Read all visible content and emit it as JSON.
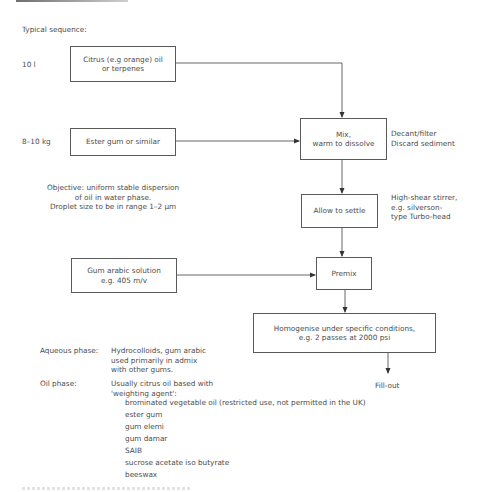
{
  "diagram": {
    "heading": "Typical sequence:",
    "quantities": {
      "citrus": "10 l",
      "ester": "8–10 kg"
    },
    "boxes": {
      "citrus": "Citrus (e.g orange) oil\nor terpenes",
      "ester": "Ester gum or similar",
      "mix": "Mix,\nwarm to dissolve",
      "settle": "Allow to settle",
      "gum_arabic": "Gum arabic solution\ne.g. 405 m/v",
      "premix": "Premix",
      "homogenise": "Homogenise under specific conditions,\ne.g. 2 passes at 2000 psi"
    },
    "annotations": {
      "mix_side": "Decant/filter\nDiscard sediment",
      "settle_side": "High-shear stirrer,\ne.g. silverson-\ntype Turbo-head",
      "objective": "Objective: uniform stable dispersion\nof oil in water phase.\nDroplet size to be in range 1–2 μm",
      "fill_out": "Fill-out"
    },
    "notes": {
      "aqueous_label": "Aqueous phase:",
      "aqueous_text": "Hydrocolloids, gum arabic\nused primarily in admix\nwith other gums.",
      "oil_label": "Oil phase:",
      "oil_text": "Usually citrus oil based with\n'weighting agent':",
      "oil_agents": [
        "brominated vegetable oil (restricted use, not permitted in the UK)",
        "ester gum",
        "gum elemi",
        "gum damar",
        "SAIB",
        "sucrose acetate iso butyrate",
        "beeswax"
      ]
    }
  }
}
